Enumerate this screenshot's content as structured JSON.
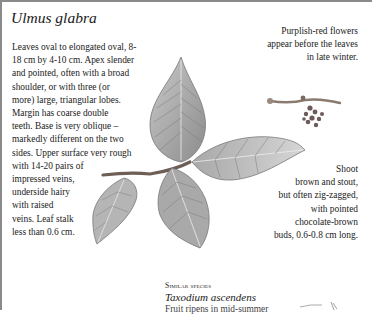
{
  "page": {
    "title": "Ulmus glabra",
    "description_lines": [
      "Leaves oval to elongated oval, 8-",
      "18 cm by 4-10 cm. Apex slender",
      "and pointed, often with a broad",
      "shoulder, or with three (or",
      "more) large, triangular lobes.",
      "Margin has coarse double",
      "teeth. Base is very oblique –",
      "markedly different on the two",
      "sides. Upper surface very rough",
      "with 14-20 pairs of",
      "impressed veins,",
      "underside hairy",
      "with raised",
      "veins. Leaf stalk",
      "less than 0.6 cm."
    ],
    "flowers_note_lines": [
      "Purplish-red flowers",
      "appear before the leaves",
      "in late winter."
    ],
    "shoot_note_lines": [
      "Shoot",
      "brown and stout,",
      "but often zig-zagged,",
      "with pointed",
      "chocolate-brown",
      "buds, 0.6-0.8 cm long."
    ],
    "similar_species": {
      "label": "Similar species",
      "name": "Taxodium ascendens",
      "partial_text": "Fruit ripens in mid-summer"
    },
    "illustrations": [
      {
        "name": "leafy-shoot-illustration"
      },
      {
        "name": "flower-cluster-illustration"
      },
      {
        "name": "similar-species-thumbnail"
      }
    ],
    "colors": {
      "frame": "#8a8a8a",
      "text": "#222222",
      "leaf": "#9a9a9a"
    }
  }
}
